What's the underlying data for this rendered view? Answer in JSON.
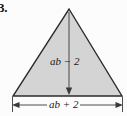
{
  "figure": {
    "problem_number": "3.",
    "shape": "triangle",
    "fill_color": "#d4d4d4",
    "stroke_color": "#2b2b2b",
    "background_color": "#fcfcfc",
    "label_color": "#1a1a1a",
    "height_label": "ab − 2",
    "base_label": "ab + 2",
    "height_dimension_name": "height",
    "base_dimension_name": "base",
    "apex": {
      "x": 69,
      "y": 9
    },
    "base_left": {
      "x": 13,
      "y": 96
    },
    "base_right": {
      "x": 122,
      "y": 96
    }
  }
}
